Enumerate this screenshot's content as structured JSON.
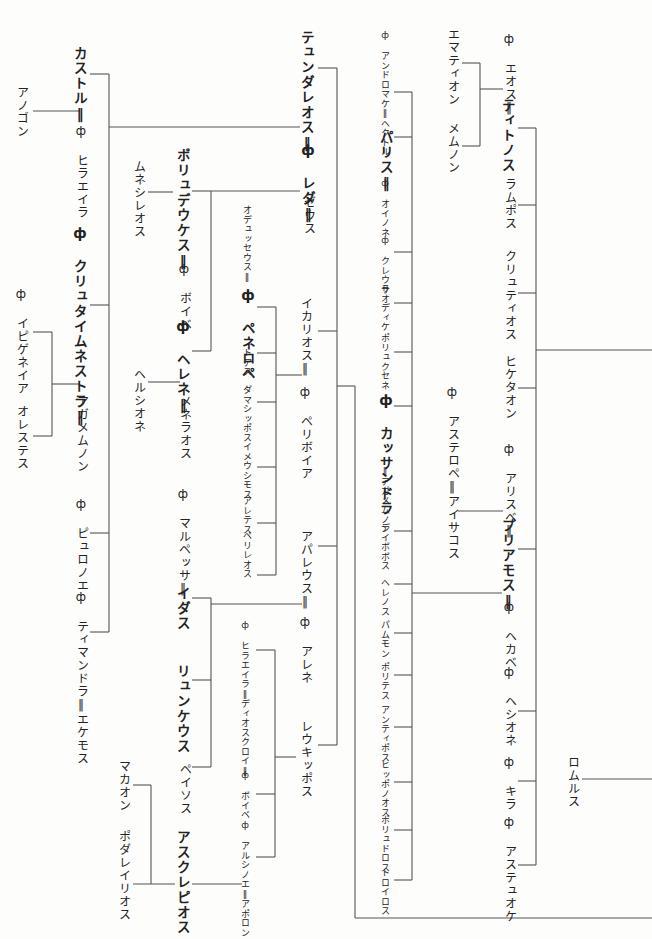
{
  "diagram": {
    "type": "genealogy-tree",
    "orientation": "vertical-japanese",
    "female_marker": "ф",
    "marriage_marker": "‖",
    "line_color": "#555555",
    "text_color": "#222222",
    "background": "#fdfdfc"
  },
  "nodes": [
    {
      "id": "anogon",
      "text": "アノゴン",
      "x": 14,
      "y": 86,
      "style": "normal"
    },
    {
      "id": "kastor",
      "text": "カストル‖",
      "x": 73,
      "y": 46,
      "style": "bold"
    },
    {
      "id": "hilaeira1",
      "text": "ф ヒラエイラ",
      "x": 74,
      "y": 124,
      "style": "normal"
    },
    {
      "id": "klytaimnestra",
      "text": "ф クリュタイムネストラ‖",
      "x": 73,
      "y": 225,
      "style": "bold"
    },
    {
      "id": "agamemnon",
      "text": "アガメムノン",
      "x": 74,
      "y": 395,
      "style": "normal"
    },
    {
      "id": "iphigeneia",
      "text": "ф イピゲネイア",
      "x": 14,
      "y": 287,
      "style": "normal"
    },
    {
      "id": "orestes",
      "text": "オレステス",
      "x": 14,
      "y": 405,
      "style": "normal"
    },
    {
      "id": "pyrrhoe",
      "text": "ф ピュロノエ",
      "x": 74,
      "y": 497,
      "style": "normal"
    },
    {
      "id": "timandra",
      "text": "ф ティマンドラ‖エケモス",
      "x": 74,
      "y": 590,
      "style": "normal"
    },
    {
      "id": "mnesileos",
      "text": "ムネシレオス",
      "x": 131,
      "y": 160,
      "style": "normal"
    },
    {
      "id": "polydeukes",
      "text": "ポリュデウケス‖",
      "x": 176,
      "y": 148,
      "style": "bold"
    },
    {
      "id": "phoibe1",
      "text": "ф ボイベ",
      "x": 177,
      "y": 262,
      "style": "normal"
    },
    {
      "id": "helene",
      "text": "ф ヘレネ‖",
      "x": 176,
      "y": 318,
      "style": "bold"
    },
    {
      "id": "menelaos",
      "text": "メネラオス",
      "x": 177,
      "y": 395,
      "style": "normal"
    },
    {
      "id": "hermione",
      "text": "ヘルシオネ",
      "x": 131,
      "y": 368,
      "style": "normal"
    },
    {
      "id": "marpessa",
      "text": "ф マルペッサ‖",
      "x": 176,
      "y": 487,
      "style": "normal"
    },
    {
      "id": "idas",
      "text": "イダス",
      "x": 176,
      "y": 586,
      "style": "bold"
    },
    {
      "id": "lynkeus",
      "text": "リュンケウス",
      "x": 176,
      "y": 664,
      "style": "bold"
    },
    {
      "id": "peisos",
      "text": "ペイソス",
      "x": 177,
      "y": 763,
      "style": "normal"
    },
    {
      "id": "machaon",
      "text": "マカオン",
      "x": 116,
      "y": 760,
      "style": "normal"
    },
    {
      "id": "podaleirios",
      "text": "ポダレイリオス",
      "x": 116,
      "y": 830,
      "style": "normal"
    },
    {
      "id": "asklepios",
      "text": "アスクレピオス",
      "x": 176,
      "y": 830,
      "style": "bold"
    },
    {
      "id": "tyndareos",
      "text": "テュンダレオス‖",
      "x": 300,
      "y": 30,
      "style": "bold"
    },
    {
      "id": "leda",
      "text": "ф レダ‖",
      "x": 301,
      "y": 142,
      "style": "bold"
    },
    {
      "id": "zeus",
      "text": "ゼウス",
      "x": 301,
      "y": 196,
      "style": "normal"
    },
    {
      "id": "odysseus",
      "text": "オデュッセウス‖",
      "x": 242,
      "y": 205,
      "style": "small"
    },
    {
      "id": "penelope",
      "text": "ф ペネロペ",
      "x": 241,
      "y": 287,
      "style": "bold"
    },
    {
      "id": "thoas",
      "text": "トアス",
      "x": 242,
      "y": 348,
      "style": "small"
    },
    {
      "id": "damasippos",
      "text": "ダマシッポス",
      "x": 242,
      "y": 385,
      "style": "small"
    },
    {
      "id": "imeusimos",
      "text": "イメウシモス",
      "x": 242,
      "y": 442,
      "style": "small"
    },
    {
      "id": "aletes",
      "text": "アレテス",
      "x": 242,
      "y": 496,
      "style": "small"
    },
    {
      "id": "perileos",
      "text": "ペリレオス",
      "x": 242,
      "y": 531,
      "style": "small"
    },
    {
      "id": "ikarios",
      "text": "イカリオス‖",
      "x": 298,
      "y": 297,
      "style": "normal"
    },
    {
      "id": "periboia",
      "text": "ф ペリボイア",
      "x": 298,
      "y": 385,
      "style": "normal"
    },
    {
      "id": "aphareus",
      "text": "アパレウス‖",
      "x": 298,
      "y": 530,
      "style": "normal"
    },
    {
      "id": "arene",
      "text": "ф アレネ",
      "x": 298,
      "y": 615,
      "style": "normal"
    },
    {
      "id": "hilaeira2",
      "text": "ф ヒラエイラ‖ディオスクロイ‖",
      "x": 240,
      "y": 620,
      "style": "small"
    },
    {
      "id": "phoibe2",
      "text": "ф ボイベ",
      "x": 240,
      "y": 770,
      "style": "small"
    },
    {
      "id": "arsinoe",
      "text": "ф アルシノエ‖アポロン",
      "x": 240,
      "y": 820,
      "style": "small"
    },
    {
      "id": "leukippos",
      "text": "レウキッポス",
      "x": 298,
      "y": 720,
      "style": "normal"
    },
    {
      "id": "andromache",
      "text": "ф アンドロマケ‖ヘクトル",
      "x": 380,
      "y": 30,
      "style": "small"
    },
    {
      "id": "paris",
      "text": "パリス‖",
      "x": 379,
      "y": 130,
      "style": "bold"
    },
    {
      "id": "oinone",
      "text": "ф オイノネ",
      "x": 380,
      "y": 178,
      "style": "small"
    },
    {
      "id": "kreousa",
      "text": "ф クレウサ",
      "x": 380,
      "y": 235,
      "style": "small"
    },
    {
      "id": "laodike",
      "text": "ラオディケ",
      "x": 380,
      "y": 284,
      "style": "small"
    },
    {
      "id": "polyxene",
      "text": "ポリュクセネ",
      "x": 380,
      "y": 333,
      "style": "small"
    },
    {
      "id": "kassandra",
      "text": "ф カッサンドラ",
      "x": 379,
      "y": 392,
      "style": "bold"
    },
    {
      "id": "agamemnon2",
      "text": "‖アガメムノン",
      "x": 380,
      "y": 466,
      "style": "small"
    },
    {
      "id": "deiphobos",
      "text": "デイボボス",
      "x": 380,
      "y": 523,
      "style": "small"
    },
    {
      "id": "helenos",
      "text": "ヘレノス",
      "x": 380,
      "y": 578,
      "style": "small"
    },
    {
      "id": "pammon",
      "text": "パムモン",
      "x": 380,
      "y": 620,
      "style": "small"
    },
    {
      "id": "polites",
      "text": "ポリテス",
      "x": 380,
      "y": 662,
      "style": "small"
    },
    {
      "id": "antiphos",
      "text": "アンティポス",
      "x": 380,
      "y": 705,
      "style": "small"
    },
    {
      "id": "hipponoos",
      "text": "ヒッポノオス",
      "x": 380,
      "y": 760,
      "style": "small"
    },
    {
      "id": "polydoros",
      "text": "ポリュドロス",
      "x": 380,
      "y": 815,
      "style": "small"
    },
    {
      "id": "troilos",
      "text": "トロイロス",
      "x": 380,
      "y": 868,
      "style": "small"
    },
    {
      "id": "emathion",
      "text": "エマティオン",
      "x": 445,
      "y": 28,
      "style": "normal"
    },
    {
      "id": "memnon",
      "text": "メムノン",
      "x": 445,
      "y": 122,
      "style": "normal"
    },
    {
      "id": "eos",
      "text": "ф エオス‖",
      "x": 502,
      "y": 32,
      "style": "normal"
    },
    {
      "id": "tithonos",
      "text": "ティトノス",
      "x": 501,
      "y": 98,
      "style": "bold"
    },
    {
      "id": "lampos",
      "text": "ラムポス",
      "x": 502,
      "y": 178,
      "style": "normal"
    },
    {
      "id": "klytios",
      "text": "クリュティオス",
      "x": 502,
      "y": 250,
      "style": "normal"
    },
    {
      "id": "hiketaon",
      "text": "ヒケタオン",
      "x": 502,
      "y": 355,
      "style": "normal"
    },
    {
      "id": "asterope",
      "text": "ф アステロペ‖アイサコス",
      "x": 445,
      "y": 385,
      "style": "normal"
    },
    {
      "id": "arisbe",
      "text": "ф アリスベ‖",
      "x": 502,
      "y": 442,
      "style": "normal"
    },
    {
      "id": "priamos",
      "text": "プリアモス‖",
      "x": 501,
      "y": 518,
      "style": "bold"
    },
    {
      "id": "hekabe",
      "text": "ф ヘカベ",
      "x": 502,
      "y": 600,
      "style": "normal"
    },
    {
      "id": "hesione",
      "text": "ф ヘシオネ",
      "x": 502,
      "y": 665,
      "style": "normal"
    },
    {
      "id": "killa",
      "text": "ф キラ",
      "x": 502,
      "y": 755,
      "style": "normal"
    },
    {
      "id": "astyoche",
      "text": "ф アステュオケ",
      "x": 502,
      "y": 815,
      "style": "normal"
    },
    {
      "id": "romulus",
      "text": "ロムルス",
      "x": 565,
      "y": 756,
      "style": "normal"
    }
  ]
}
